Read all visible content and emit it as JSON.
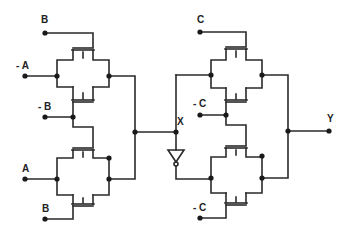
{
  "diagram": {
    "type": "transmission-gate-logic-circuit",
    "colors": {
      "wire": "#2a2a2a",
      "background": "#ffffff"
    },
    "labels": {
      "b_top": "B",
      "not_a": "- A",
      "not_b": "- B",
      "a": "A",
      "b_bottom": "B",
      "c_top": "C",
      "x": "X",
      "not_c_top": "- C",
      "not_c_bottom": "- C",
      "y": "Y"
    },
    "components": [
      {
        "id": "tg1",
        "control": "B",
        "input": "- A"
      },
      {
        "id": "tg2",
        "control": "- B",
        "input": "- A"
      },
      {
        "id": "tg3",
        "control": "- B",
        "input": "A"
      },
      {
        "id": "tg4",
        "control": "B",
        "input": "A"
      },
      {
        "id": "tg5",
        "control": "C",
        "input": "X"
      },
      {
        "id": "tg6",
        "control": "- C",
        "input": "X"
      },
      {
        "id": "inv1",
        "type": "inverter",
        "input": "X"
      },
      {
        "id": "tg7",
        "control": "- C",
        "input": "inverted X"
      },
      {
        "id": "tg8",
        "control": "- C",
        "input": "inverted X"
      }
    ],
    "output": "Y"
  }
}
